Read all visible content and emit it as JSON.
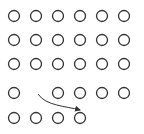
{
  "diagram": {
    "type": "dot-grid-with-move-arrow",
    "background": "#ffffff",
    "stroke_color": "#333333",
    "circle_radius": 5.5,
    "circle_stroke_width": 1.3,
    "columns_x": [
      14,
      36,
      58,
      80,
      102,
      124
    ],
    "rows_y": [
      16,
      40,
      64,
      93,
      118
    ],
    "grid": [
      [
        1,
        1,
        1,
        1,
        1,
        1
      ],
      [
        1,
        1,
        1,
        1,
        1,
        1
      ],
      [
        1,
        1,
        1,
        1,
        1,
        1
      ],
      [
        1,
        0,
        1,
        1,
        1,
        1
      ],
      [
        1,
        1,
        1,
        1,
        0,
        0
      ]
    ],
    "arrow": {
      "from": {
        "row": 4,
        "col": 2,
        "x": 38,
        "y": 94
      },
      "to": {
        "row": 5,
        "col": 4,
        "x": 80,
        "y": 110
      },
      "path": "M38,94 C46,106 66,106 80,110"
    }
  }
}
